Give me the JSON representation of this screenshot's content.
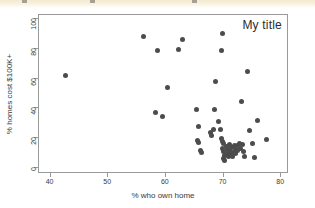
{
  "toolbar_strip": {
    "visible": true,
    "color": "#f5edd7",
    "smudges_x": [
      22,
      90,
      192
    ]
  },
  "figure": {
    "background": "#ffffff",
    "frame_color": "#9a9a9a",
    "marker_color": "#4c4c4c"
  },
  "chart_data": {
    "type": "scatter",
    "title": "My title",
    "title_position": "top-right-inside",
    "xlabel": "% who own home",
    "ylabel": "% homes cost $100K+",
    "xlim": [
      38,
      81
    ],
    "ylim": [
      -3,
      103
    ],
    "xticks": [
      40,
      50,
      60,
      70,
      80
    ],
    "xticklabels": [
      "40",
      "50",
      "60",
      "70",
      "80"
    ],
    "yticks": [
      0,
      20,
      40,
      60,
      80,
      100
    ],
    "yticklabels": [
      "0",
      "20",
      "40",
      "60",
      "80",
      "100"
    ],
    "grid": false,
    "legend": false,
    "marker": "circle",
    "marker_color": "#4c4c4c",
    "points": [
      {
        "x": 42.6,
        "y": 62.0
      },
      {
        "x": 56.1,
        "y": 88.8
      },
      {
        "x": 58.5,
        "y": 78.8
      },
      {
        "x": 58.2,
        "y": 37.3
      },
      {
        "x": 59.4,
        "y": 34.7
      },
      {
        "x": 60.2,
        "y": 54.2
      },
      {
        "x": 62.2,
        "y": 79.5
      },
      {
        "x": 62.9,
        "y": 86.6
      },
      {
        "x": 65.3,
        "y": 38.9
      },
      {
        "x": 65.6,
        "y": 27.4
      },
      {
        "x": 65.5,
        "y": 18.2
      },
      {
        "x": 65.6,
        "y": 17.1
      },
      {
        "x": 66.0,
        "y": 11.2
      },
      {
        "x": 66.1,
        "y": 10.4
      },
      {
        "x": 67.8,
        "y": 23.4
      },
      {
        "x": 67.9,
        "y": 21.7
      },
      {
        "x": 68.3,
        "y": 25.8
      },
      {
        "x": 68.5,
        "y": 39.2
      },
      {
        "x": 68.6,
        "y": 57.8
      },
      {
        "x": 69.1,
        "y": 31.2
      },
      {
        "x": 69.4,
        "y": 25.5
      },
      {
        "x": 69.6,
        "y": 79.0
      },
      {
        "x": 69.9,
        "y": 90.6
      },
      {
        "x": 69.7,
        "y": 19.4
      },
      {
        "x": 69.9,
        "y": 17.6
      },
      {
        "x": 70.0,
        "y": 16.2
      },
      {
        "x": 69.8,
        "y": 13.0
      },
      {
        "x": 70.0,
        "y": 11.0
      },
      {
        "x": 70.1,
        "y": 8.4
      },
      {
        "x": 70.0,
        "y": 6.2
      },
      {
        "x": 70.2,
        "y": 4.8
      },
      {
        "x": 70.5,
        "y": 14.3
      },
      {
        "x": 70.6,
        "y": 12.0
      },
      {
        "x": 70.7,
        "y": 9.6
      },
      {
        "x": 70.8,
        "y": 7.4
      },
      {
        "x": 71.0,
        "y": 15.6
      },
      {
        "x": 71.1,
        "y": 11.8
      },
      {
        "x": 71.2,
        "y": 9.0
      },
      {
        "x": 71.4,
        "y": 13.4
      },
      {
        "x": 71.5,
        "y": 10.2
      },
      {
        "x": 71.6,
        "y": 7.8
      },
      {
        "x": 71.9,
        "y": 14.8
      },
      {
        "x": 72.0,
        "y": 12.4
      },
      {
        "x": 72.1,
        "y": 9.8
      },
      {
        "x": 72.4,
        "y": 15.0
      },
      {
        "x": 72.5,
        "y": 11.4
      },
      {
        "x": 72.7,
        "y": 16.4
      },
      {
        "x": 72.9,
        "y": 13.1
      },
      {
        "x": 73.1,
        "y": 44.8
      },
      {
        "x": 73.2,
        "y": 15.4
      },
      {
        "x": 73.4,
        "y": 10.6
      },
      {
        "x": 73.6,
        "y": 7.2
      },
      {
        "x": 74.1,
        "y": 65.1
      },
      {
        "x": 74.5,
        "y": 25.3
      },
      {
        "x": 75.1,
        "y": 16.1
      },
      {
        "x": 75.3,
        "y": 7.0
      },
      {
        "x": 75.9,
        "y": 31.6
      },
      {
        "x": 77.4,
        "y": 19.0
      }
    ]
  }
}
